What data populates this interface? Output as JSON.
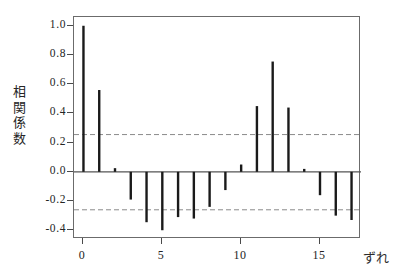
{
  "chart_data": {
    "type": "bar",
    "title": "",
    "subtitle": "",
    "xlabel": "ずれ",
    "ylabel": "相関係数",
    "ylabel_chars": "相\n関\n係\n数",
    "x": [
      0,
      1,
      2,
      3,
      4,
      5,
      6,
      7,
      8,
      9,
      10,
      11,
      12,
      13,
      14,
      15,
      16,
      17
    ],
    "values": [
      1.0,
      0.56,
      0.025,
      -0.19,
      -0.345,
      -0.4,
      -0.31,
      -0.32,
      -0.24,
      -0.125,
      0.05,
      0.45,
      0.755,
      0.44,
      0.02,
      -0.16,
      -0.3,
      -0.33
    ],
    "categories": [
      "0",
      "1",
      "2",
      "3",
      "4",
      "5",
      "6",
      "7",
      "8",
      "9",
      "10",
      "11",
      "12",
      "13",
      "14",
      "15",
      "16",
      "17"
    ],
    "series": [
      {
        "name": "相関係数",
        "values": [
          1.0,
          0.56,
          0.025,
          -0.19,
          -0.345,
          -0.4,
          -0.31,
          -0.32,
          -0.24,
          -0.125,
          0.05,
          0.45,
          0.755,
          0.44,
          0.02,
          -0.16,
          -0.3,
          -0.33
        ]
      }
    ],
    "xlim": [
      -0.6,
      17.6
    ],
    "ylim": [
      -0.46,
      1.06
    ],
    "xticks": [
      0,
      5,
      10,
      15
    ],
    "xticklabels": [
      "0",
      "5",
      "10",
      "15"
    ],
    "yticks": [
      1.0,
      0.8,
      0.6,
      0.4,
      0.2,
      0.0,
      -0.2,
      -0.4
    ],
    "yticklabels": [
      "1.0",
      "0.8",
      "0.6",
      "0.4",
      "0.2",
      "0.0",
      "-0.2",
      "-0.4"
    ],
    "grid": false,
    "legend": null,
    "legend_position": "none",
    "zero_line": 0.0,
    "confidence_bands": {
      "upper": 0.255,
      "lower": -0.26,
      "style": "dashed"
    },
    "annotations": [],
    "colors": {
      "bar": "#1a1a1a",
      "axis": "#6b6b6b",
      "zero_line": "#555555",
      "confidence_line": "#8a8a8a",
      "background": "#ffffff",
      "text": "#242424"
    }
  }
}
